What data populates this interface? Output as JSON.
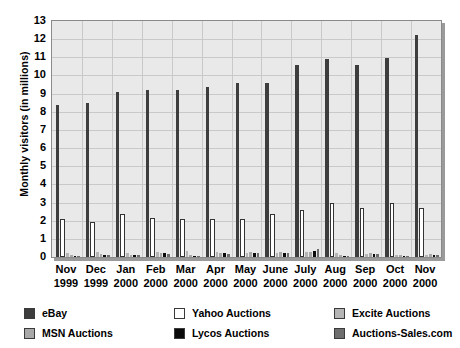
{
  "chart_data": {
    "type": "bar",
    "title": "",
    "xlabel": "",
    "ylabel": "Monthly visitors (in millions)",
    "ylim": [
      0,
      13
    ],
    "ytick_step": 1,
    "yticks": [
      0,
      1,
      2,
      3,
      4,
      5,
      6,
      7,
      8,
      9,
      10,
      11,
      12,
      13
    ],
    "grid": true,
    "legend_position": "bottom",
    "categories": [
      "Nov 1999",
      "Dec 1999",
      "Jan 2000",
      "Feb 2000",
      "Mar 2000",
      "Apr 2000",
      "May 2000",
      "June 2000",
      "July 2000",
      "Aug 2000",
      "Sep 2000",
      "Oct 2000",
      "Nov 2000"
    ],
    "category_lines": [
      [
        "Nov",
        "1999"
      ],
      [
        "Dec",
        "1999"
      ],
      [
        "Jan",
        "2000"
      ],
      [
        "Feb",
        "2000"
      ],
      [
        "Mar",
        "2000"
      ],
      [
        "Apr",
        "2000"
      ],
      [
        "May",
        "2000"
      ],
      [
        "June",
        "2000"
      ],
      [
        "July",
        "2000"
      ],
      [
        "Aug",
        "2000"
      ],
      [
        "Sep",
        "2000"
      ],
      [
        "Oct",
        "2000"
      ],
      [
        "Nov",
        "2000"
      ]
    ],
    "series": [
      {
        "name": "eBay",
        "color": "#3d3d3d",
        "values": [
          8.35,
          8.5,
          9.1,
          9.2,
          9.2,
          9.35,
          9.6,
          9.6,
          10.55,
          10.9,
          10.6,
          10.95,
          12.25
        ]
      },
      {
        "name": "Yahoo Auctions",
        "color": "#ffffff",
        "values": [
          2.1,
          1.95,
          2.35,
          2.15,
          2.1,
          2.1,
          2.1,
          2.35,
          2.6,
          2.95,
          2.7,
          2.95,
          2.7
        ]
      },
      {
        "name": "Excite Auctions",
        "color": "#b5b5b5",
        "values": [
          0.2,
          0.3,
          0.2,
          0.25,
          0.35,
          0.25,
          0.2,
          0.2,
          0.25,
          0.2,
          0.18,
          0.12,
          0.13
        ]
      },
      {
        "name": "MSN Auctions",
        "color": "#a8a8a8",
        "values": [
          0.1,
          0.15,
          0.12,
          0.22,
          0.1,
          0.22,
          0.25,
          0.25,
          0.3,
          0.1,
          0.2,
          0.1,
          0.15
        ]
      },
      {
        "name": "Lycos Auctions",
        "color": "#0a0a0a",
        "values": [
          0.08,
          0.12,
          0.1,
          0.2,
          0.08,
          0.2,
          0.22,
          0.24,
          0.35,
          0.08,
          0.18,
          0.08,
          0.12
        ]
      },
      {
        "name": "Auctions-Sales.com",
        "color": "#6e6e6e",
        "values": [
          0.06,
          0.1,
          0.09,
          0.18,
          0.07,
          0.18,
          0.2,
          0.22,
          0.45,
          0.07,
          0.16,
          0.07,
          0.1
        ]
      }
    ],
    "legend": [
      {
        "label": "eBay",
        "color": "#3d3d3d"
      },
      {
        "label": "Yahoo Auctions",
        "color": "#ffffff"
      },
      {
        "label": "Excite Auctions",
        "color": "#b5b5b5"
      },
      {
        "label": "MSN Auctions",
        "color": "#a8a8a8"
      },
      {
        "label": "Lycos Auctions",
        "color": "#0a0a0a"
      },
      {
        "label": "Auctions-Sales.com",
        "color": "#6e6e6e"
      }
    ]
  }
}
